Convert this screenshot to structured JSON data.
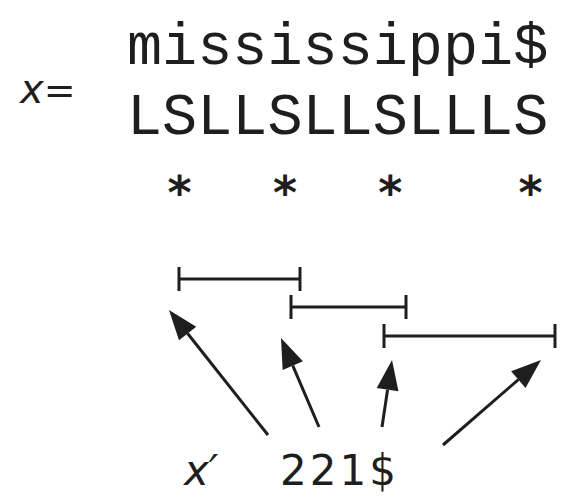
{
  "figure": {
    "top_caption_fragment": "",
    "variable_label": "x",
    "equals": "=",
    "string": "mississippi$",
    "type_sequence": "LSLLSLLSLLLS",
    "lms_marker": "*",
    "lms_positions": [
      1,
      4,
      7,
      11
    ],
    "lms_substrings": [
      {
        "start": 1,
        "end": 4
      },
      {
        "start": 4,
        "end": 7
      },
      {
        "start": 7,
        "end": 11
      }
    ],
    "reduced_label": "x′",
    "reduced_string": "221$",
    "colors": {
      "ink": "#1e1e1e",
      "background": "#ffffff"
    }
  }
}
